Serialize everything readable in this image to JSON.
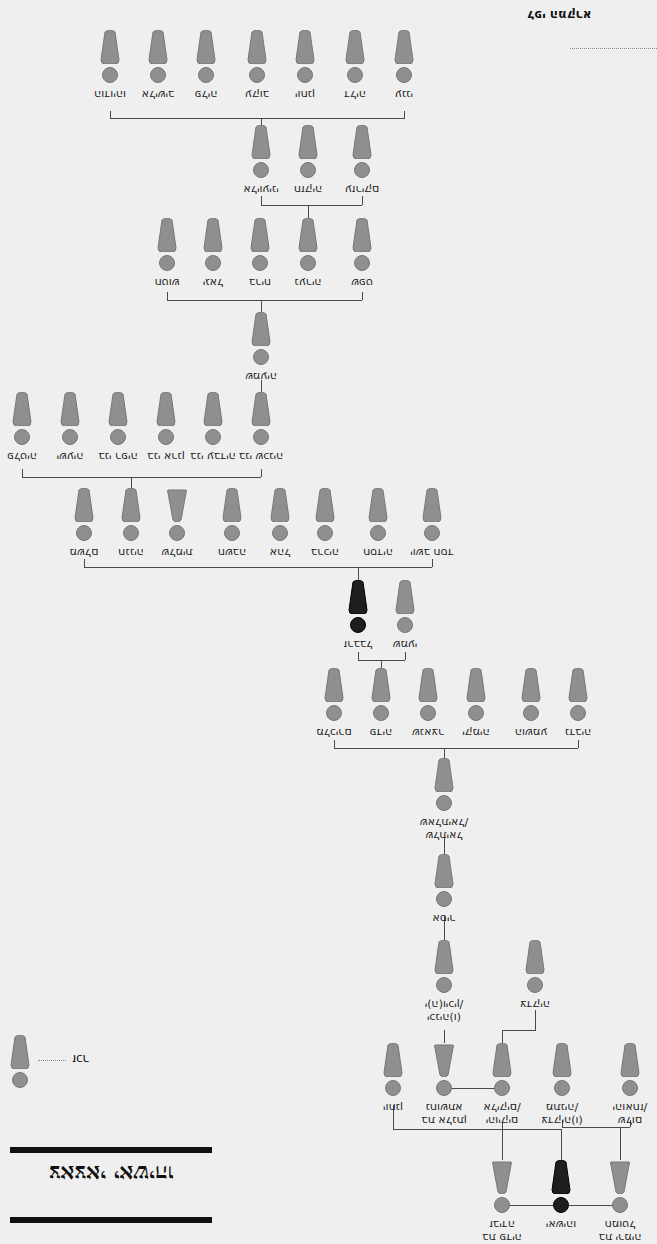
{
  "header": {
    "note": "לפי המקרא"
  },
  "legend": {
    "male_label": "זכר"
  },
  "title": "צאצאי יאשיהו",
  "colors": {
    "male_fill": "#8f8f8f",
    "highlight_fill": "#1e1e1e",
    "line": "#4a4a4a",
    "background": "#efefef"
  },
  "nodes": [
    {
      "id": "r1_1",
      "name": "הודויהו",
      "x": 110,
      "y": 30,
      "sex": "m"
    },
    {
      "id": "r1_2",
      "name": "אלישיב",
      "x": 158,
      "y": 30,
      "sex": "m"
    },
    {
      "id": "r1_3",
      "name": "פליה",
      "x": 206,
      "y": 30,
      "sex": "m"
    },
    {
      "id": "r1_4",
      "name": "עקוב",
      "x": 257,
      "y": 30,
      "sex": "m"
    },
    {
      "id": "r1_5",
      "name": "יוחנן",
      "x": 305,
      "y": 30,
      "sex": "m"
    },
    {
      "id": "r1_6",
      "name": "דליה",
      "x": 355,
      "y": 30,
      "sex": "m"
    },
    {
      "id": "r1_7",
      "name": "ענני",
      "x": 404,
      "y": 30,
      "sex": "m"
    },
    {
      "id": "r2_1",
      "name": "אליועיני",
      "x": 261,
      "y": 125,
      "sex": "m"
    },
    {
      "id": "r2_2",
      "name": "חזקיה",
      "x": 308,
      "y": 125,
      "sex": "m"
    },
    {
      "id": "r2_3",
      "name": "עזריקם",
      "x": 362,
      "y": 125,
      "sex": "m"
    },
    {
      "id": "r3_1",
      "name": "חטוש",
      "x": 167,
      "y": 218,
      "sex": "m"
    },
    {
      "id": "r3_2",
      "name": "יגאל",
      "x": 213,
      "y": 218,
      "sex": "m"
    },
    {
      "id": "r3_3",
      "name": "בריח",
      "x": 260,
      "y": 218,
      "sex": "m"
    },
    {
      "id": "r3_4",
      "name": "נעריה",
      "x": 308,
      "y": 218,
      "sex": "m"
    },
    {
      "id": "r3_5",
      "name": "שפט",
      "x": 362,
      "y": 218,
      "sex": "m"
    },
    {
      "id": "r4_1",
      "name": "שמעיה",
      "x": 261,
      "y": 312,
      "sex": "m"
    },
    {
      "id": "r5_1",
      "name": "פלטיה",
      "x": 22,
      "y": 392,
      "sex": "m"
    },
    {
      "id": "r5_2",
      "name": "ישעיה",
      "x": 70,
      "y": 392,
      "sex": "m"
    },
    {
      "id": "r5_3",
      "name": "בני רפיה",
      "x": 118,
      "y": 392,
      "sex": "m"
    },
    {
      "id": "r5_4",
      "name": "בני ארנן",
      "x": 166,
      "y": 392,
      "sex": "m"
    },
    {
      "id": "r5_5",
      "name": "בני עבדיה",
      "x": 213,
      "y": 392,
      "sex": "m"
    },
    {
      "id": "r5_6",
      "name": "בני שכניה",
      "x": 261,
      "y": 392,
      "sex": "m"
    },
    {
      "id": "r6_1",
      "name": "משלם",
      "x": 84,
      "y": 488,
      "sex": "m"
    },
    {
      "id": "r6_2",
      "name": "חנניה",
      "x": 131,
      "y": 488,
      "sex": "m"
    },
    {
      "id": "r6_3",
      "name": "שלמית",
      "x": 177,
      "y": 488,
      "sex": "f"
    },
    {
      "id": "r6_4",
      "name": "חשבה",
      "x": 232,
      "y": 488,
      "sex": "m"
    },
    {
      "id": "r6_5",
      "name": "אהל",
      "x": 280,
      "y": 488,
      "sex": "m"
    },
    {
      "id": "r6_6",
      "name": "ברכיה",
      "x": 325,
      "y": 488,
      "sex": "m"
    },
    {
      "id": "r6_7",
      "name": "חסדיה",
      "x": 378,
      "y": 488,
      "sex": "m"
    },
    {
      "id": "r6_8",
      "name": "יושב חסד",
      "x": 432,
      "y": 488,
      "sex": "m"
    },
    {
      "id": "r7_1",
      "name": "זרבבל",
      "x": 358,
      "y": 580,
      "sex": "m",
      "dark": true
    },
    {
      "id": "r7_2",
      "name": "שמעי",
      "x": 405,
      "y": 580,
      "sex": "m"
    },
    {
      "id": "r8_1",
      "name": "מלכירם",
      "x": 334,
      "y": 668,
      "sex": "m"
    },
    {
      "id": "r8_2",
      "name": "פדיה",
      "x": 381,
      "y": 668,
      "sex": "m"
    },
    {
      "id": "r8_3",
      "name": "שנאצר",
      "x": 428,
      "y": 668,
      "sex": "m"
    },
    {
      "id": "r8_4",
      "name": "יקמיה",
      "x": 476,
      "y": 668,
      "sex": "m"
    },
    {
      "id": "r8_5",
      "name": "הושמע",
      "x": 531,
      "y": 668,
      "sex": "m"
    },
    {
      "id": "r8_6",
      "name": "נדביה",
      "x": 578,
      "y": 668,
      "sex": "m"
    },
    {
      "id": "r9_1",
      "name": "שלתיאל\nשאלתיאל/",
      "x": 444,
      "y": 758,
      "sex": "m"
    },
    {
      "id": "r10_1",
      "name": "אסיר",
      "x": 444,
      "y": 854,
      "sex": "m"
    },
    {
      "id": "r11_1",
      "name": "יכניה(ו)\nי(ה)ויכין/",
      "x": 444,
      "y": 940,
      "sex": "m"
    },
    {
      "id": "r11_2",
      "name": "צדקיה",
      "x": 535,
      "y": 940,
      "sex": "m"
    },
    {
      "id": "r12_1",
      "name": "יוחנן",
      "x": 393,
      "y": 1043,
      "sex": "m"
    },
    {
      "id": "r12_2",
      "name": "בת אלנתן\nנחושתא",
      "x": 444,
      "y": 1043,
      "sex": "f"
    },
    {
      "id": "r12_3",
      "name": "יהויקים\nאליקים/",
      "x": 502,
      "y": 1043,
      "sex": "m"
    },
    {
      "id": "r12_4",
      "name": "צדקיה(ו)\nמתניה/",
      "x": 562,
      "y": 1043,
      "sex": "m"
    },
    {
      "id": "r12_5",
      "name": "שלום\nיהואחז/",
      "x": 630,
      "y": 1043,
      "sex": "m"
    },
    {
      "id": "r13_1",
      "name": "בת פדיה\nזבידה",
      "x": 502,
      "y": 1160,
      "sex": "f"
    },
    {
      "id": "r13_2",
      "name": "יאשיהו",
      "x": 561,
      "y": 1160,
      "sex": "m",
      "dark": true
    },
    {
      "id": "r13_3",
      "name": "בת ירמיה\nחמוטל",
      "x": 620,
      "y": 1160,
      "sex": "f"
    }
  ]
}
